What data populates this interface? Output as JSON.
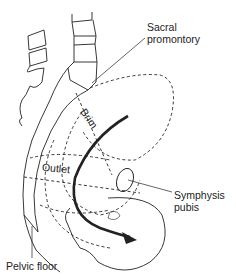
{
  "figure": {
    "labels": {
      "sacral_promontory": [
        "Sacral",
        "promontory"
      ],
      "brim": "Brim",
      "outlet": "Outlet",
      "symphysis_pubis": [
        "Symphysis",
        "pubis"
      ],
      "pelvic_floor": "Pelvic floor"
    },
    "colors": {
      "line": "#222222",
      "background": "#ffffff"
    }
  }
}
